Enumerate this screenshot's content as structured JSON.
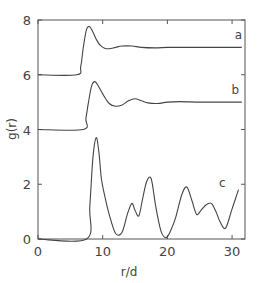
{
  "chart_data": {
    "type": "line",
    "title": "",
    "xlabel": "r/d",
    "ylabel": "g(r)",
    "xlim": [
      0,
      32
    ],
    "ylim": [
      0,
      8
    ],
    "xticks": [
      0,
      10,
      20,
      30
    ],
    "xtick_labels": [
      "0",
      "10",
      "20",
      "30"
    ],
    "yticks": [
      0,
      2,
      4,
      6,
      8
    ],
    "ytick_labels": [
      "0",
      "2",
      "4",
      "6",
      "8"
    ],
    "grid": false,
    "legend": "none",
    "series": [
      {
        "name": "a",
        "label_at": [
          31,
          7.3
        ],
        "x": [
          0,
          6.0,
          6.6,
          7.0,
          7.5,
          8.0,
          8.5,
          9.0,
          9.6,
          10.3,
          11.0,
          12.0,
          13.0,
          14.5,
          16.0,
          18.0,
          20.0,
          22.0,
          25.0,
          28.0,
          31.5
        ],
        "y": [
          6.0,
          6.0,
          6.3,
          7.0,
          7.65,
          7.75,
          7.55,
          7.3,
          7.08,
          6.97,
          6.95,
          7.0,
          7.05,
          7.05,
          7.0,
          6.98,
          7.0,
          7.0,
          7.0,
          7.0,
          7.0
        ]
      },
      {
        "name": "b",
        "label_at": [
          30.5,
          5.3
        ],
        "x": [
          0,
          7.0,
          7.4,
          7.8,
          8.3,
          8.8,
          9.3,
          10.0,
          11.0,
          12.0,
          13.0,
          14.0,
          15.0,
          16.0,
          17.0,
          18.5,
          20.0,
          22.0,
          25.0,
          28.0,
          31.5
        ],
        "y": [
          4.0,
          4.0,
          4.4,
          5.0,
          5.6,
          5.75,
          5.6,
          5.3,
          4.95,
          4.85,
          4.9,
          5.05,
          5.12,
          5.05,
          4.97,
          4.95,
          5.0,
          5.02,
          5.0,
          5.0,
          5.0
        ]
      },
      {
        "name": "c",
        "label_at": [
          28.5,
          1.9
        ],
        "x": [
          0,
          7.5,
          8.0,
          8.5,
          9.0,
          9.4,
          9.8,
          10.3,
          11.0,
          12.0,
          13.0,
          13.8,
          14.5,
          15.0,
          15.6,
          16.2,
          16.8,
          17.5,
          18.2,
          19.0,
          19.8,
          20.5,
          21.3,
          22.2,
          23.0,
          23.8,
          24.5,
          25.2,
          26.0,
          26.8,
          27.5,
          28.2,
          29.0,
          30.0,
          31.0
        ],
        "y": [
          0,
          0,
          1.2,
          3.0,
          3.7,
          3.2,
          2.2,
          1.6,
          0.9,
          0.2,
          0.25,
          0.9,
          1.3,
          1.05,
          0.85,
          1.5,
          2.1,
          2.2,
          1.2,
          0.3,
          0.05,
          0.3,
          0.8,
          1.6,
          1.9,
          1.4,
          0.9,
          1.05,
          1.25,
          1.3,
          1.0,
          0.6,
          0.4,
          1.1,
          1.8
        ]
      }
    ]
  }
}
